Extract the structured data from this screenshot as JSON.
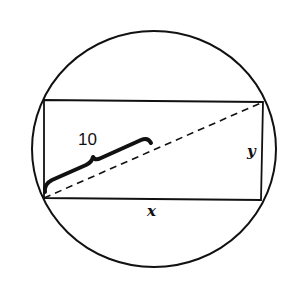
{
  "diagram": {
    "type": "geometry",
    "colors": {
      "stroke": "#111111",
      "background": "#ffffff"
    },
    "circle": {
      "cx": 154,
      "cy": 149,
      "rx": 122,
      "ry": 118
    },
    "rectangle": {
      "corners": [
        [
          44,
          100
        ],
        [
          263,
          102
        ],
        [
          261,
          200
        ],
        [
          44,
          198
        ]
      ]
    },
    "diagonal": {
      "from": [
        44,
        198
      ],
      "to": [
        263,
        102
      ],
      "style": "dashed"
    },
    "labels": {
      "brace_length": "10",
      "width": "x",
      "height": "y"
    }
  }
}
